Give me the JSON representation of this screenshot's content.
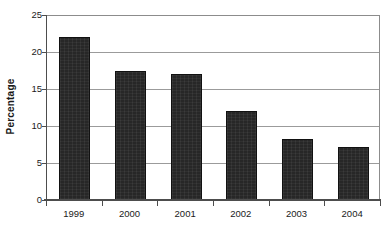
{
  "chart_data": {
    "type": "bar",
    "title": "",
    "subtitle": "",
    "xlabel": "",
    "ylabel": "Percentage",
    "categories": [
      "1999",
      "2000",
      "2001",
      "2002",
      "2003",
      "2004"
    ],
    "values": [
      22.0,
      17.5,
      17.0,
      12.0,
      8.3,
      7.2
    ],
    "series": [
      {
        "name": "Percentage",
        "values": [
          22.0,
          17.5,
          17.0,
          12.0,
          8.3,
          7.2
        ]
      }
    ],
    "ylim": [
      0,
      25
    ],
    "y_ticks": [
      0,
      5,
      10,
      15,
      20,
      25
    ],
    "y_tick_labels": [
      "0",
      "5",
      "10",
      "15",
      "20",
      "25"
    ],
    "grid": true,
    "grid_axis": "y",
    "legend": false,
    "legend_position": "none",
    "bar_color": "#272727",
    "gridline_color": "#9b9b9b",
    "axis_color": "#4d4d4d",
    "background_color": "#ffffff",
    "annotations": []
  }
}
